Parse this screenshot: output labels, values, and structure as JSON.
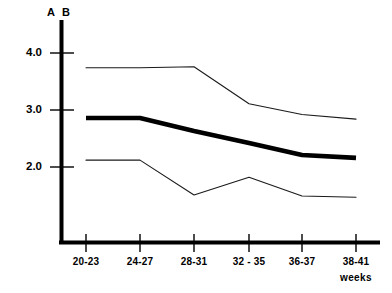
{
  "chart_data": {
    "type": "line",
    "title": "",
    "xlabel": "weeks",
    "ylabel": "",
    "categories": [
      "20-23",
      "24-27",
      "28-31",
      "32 - 35",
      "36-37",
      "38-41"
    ],
    "ylim": [
      0,
      4.5
    ],
    "yticks": [
      2.0,
      3.0,
      4.0
    ],
    "ytick_labels": [
      "2.0",
      "3.0",
      "4.0"
    ],
    "grid": false,
    "legend": "none",
    "corner_labels": [
      "A",
      "B"
    ],
    "series": [
      {
        "name": "upper-band",
        "style": "thin",
        "values": [
          3.74,
          3.74,
          3.76,
          3.11,
          2.92,
          2.84
        ]
      },
      {
        "name": "mean",
        "style": "thick",
        "values": [
          2.86,
          2.86,
          2.63,
          2.42,
          2.21,
          2.16
        ]
      },
      {
        "name": "lower-band",
        "style": "thin",
        "values": [
          2.12,
          2.12,
          1.51,
          1.82,
          1.49,
          1.47
        ]
      }
    ]
  },
  "axis": {
    "y_tick_0": "2.0",
    "y_tick_1": "3.0",
    "y_tick_2": "4.0",
    "x_tick_0": "20-23",
    "x_tick_1": "24-27",
    "x_tick_2": "28-31",
    "x_tick_3": "32 - 35",
    "x_tick_4": "36-37",
    "x_tick_5": "38-41",
    "x_title": "weeks",
    "corner_a": "A",
    "corner_b": "B"
  }
}
